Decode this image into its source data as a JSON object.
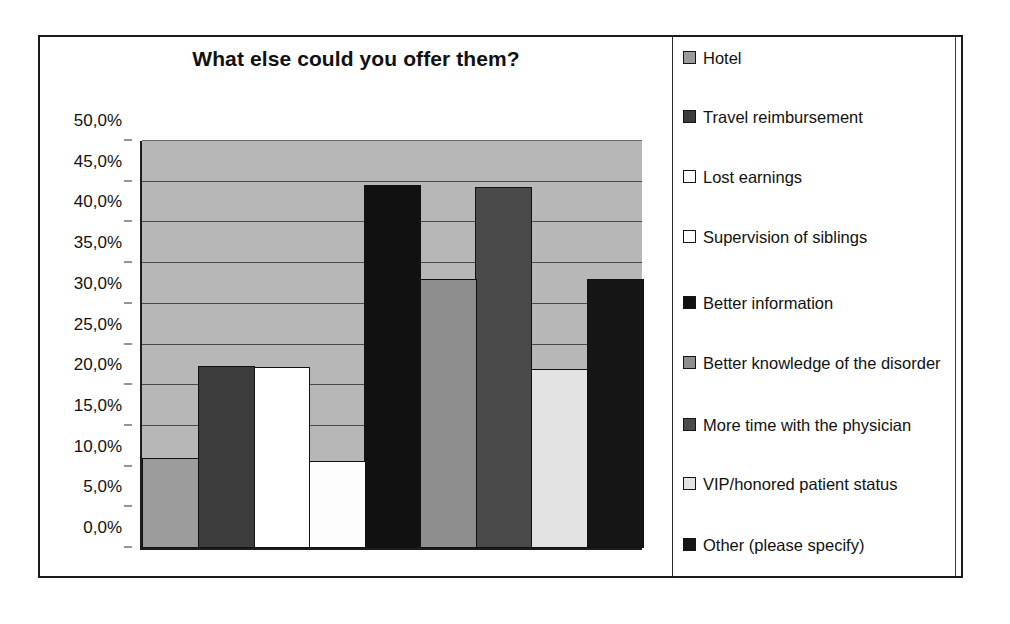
{
  "chart_data": {
    "type": "bar",
    "title": "What else could you offer them?",
    "xlabel": "",
    "ylabel": "",
    "ylim": [
      0,
      50
    ],
    "grid": true,
    "legend_position": "right",
    "decimal_separator": ",",
    "value_suffix": "%",
    "categories": [
      "Hotel",
      "Travel reimbursement",
      "Lost earnings",
      "Supervision of siblings",
      "Better information",
      "Better knowledge of the disorder",
      "More time with the physician",
      "VIP/honored patient status",
      "Other (please specify)"
    ],
    "values": [
      11.0,
      22.3,
      22.2,
      10.7,
      44.6,
      33.0,
      44.3,
      22.0,
      33.1
    ],
    "tick_labels": [
      "50,0%",
      "45,0%",
      "40,0%",
      "35,0%",
      "30,0%",
      "25,0%",
      "20,0%",
      "15,0%",
      "10,0%",
      "5,0%",
      "0,0%"
    ],
    "tick_values": [
      50,
      45,
      40,
      35,
      30,
      25,
      20,
      15,
      10,
      5,
      0
    ],
    "series_colors": [
      "#9c9c9c",
      "#3c3c3c",
      "#ffffff",
      "#fdfdfd",
      "#111111",
      "#8e8e8e",
      "#4a4a4a",
      "#e3e3e3",
      "#151515"
    ],
    "plot_background": "#b7b7b7"
  },
  "legend": {
    "items": [
      {
        "label": "Hotel",
        "color": "#9c9c9c"
      },
      {
        "label": "Travel reimbursement",
        "color": "#3c3c3c"
      },
      {
        "label": "Lost earnings",
        "color": "#ffffff"
      },
      {
        "label": "Supervision of siblings",
        "color": "#fdfdfd"
      },
      {
        "label": "Better information",
        "color": "#111111"
      },
      {
        "label": "Better knowledge of the disorder",
        "color": "#8e8e8e"
      },
      {
        "label": "More time with the physician",
        "color": "#4a4a4a"
      },
      {
        "label": "VIP/honored patient status",
        "color": "#e3e3e3"
      },
      {
        "label": "Other (please specify)",
        "color": "#151515"
      }
    ]
  }
}
